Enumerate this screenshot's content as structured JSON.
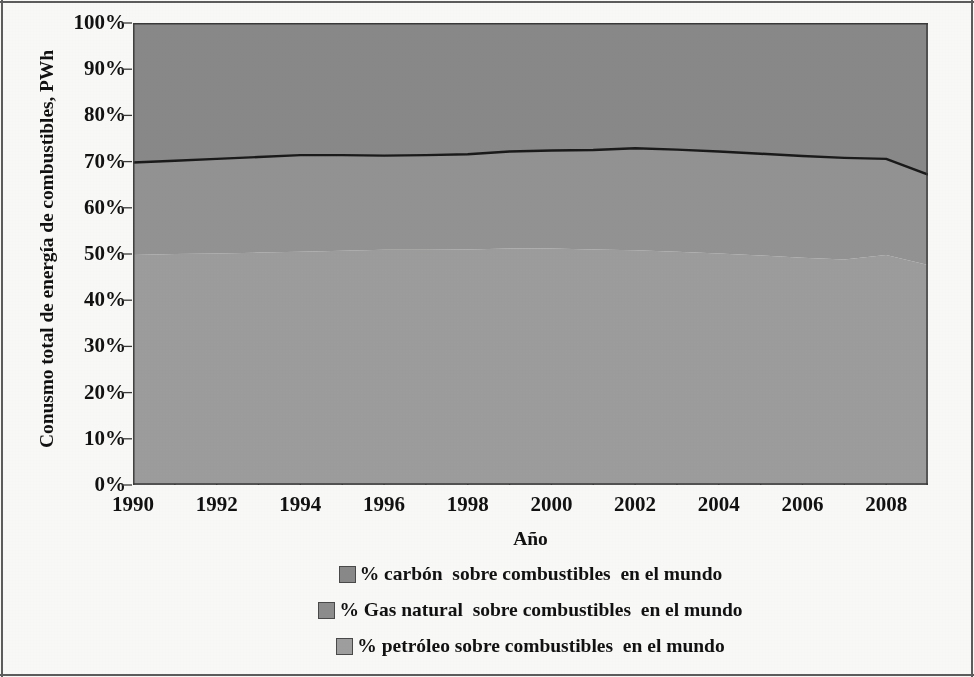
{
  "chart_data": {
    "type": "area",
    "title": "",
    "xlabel": "Año",
    "ylabel": "Conusmo total de energía de combustibles, PWh",
    "xlim": [
      1990,
      2009
    ],
    "ylim": [
      0,
      1
    ],
    "grid": false,
    "stacked": true,
    "legend_position": "bottom",
    "x": [
      1990,
      1991,
      1992,
      1993,
      1994,
      1995,
      1996,
      1997,
      1998,
      1999,
      2000,
      2001,
      2002,
      2003,
      2004,
      2005,
      2006,
      2007,
      2008,
      2009
    ],
    "xtick_labels": [
      "1990",
      "1992",
      "1994",
      "1996",
      "1998",
      "2000",
      "2002",
      "2004",
      "2006",
      "2008"
    ],
    "xtick_values": [
      1990,
      1992,
      1994,
      1996,
      1998,
      2000,
      2002,
      2004,
      2006,
      2008
    ],
    "ytick_labels": [
      "100%",
      "90%",
      "80%",
      "70%",
      "60%",
      "50%",
      "40%",
      "30%",
      "20%",
      "10%",
      "0%"
    ],
    "ytick_values": [
      1.0,
      0.9,
      0.8,
      0.7,
      0.6,
      0.5,
      0.4,
      0.3,
      0.2,
      0.1,
      0.0
    ],
    "series": [
      {
        "name": "% carbón  sobre combustibles  en el mundo",
        "color": "#8a8a8a",
        "stack_order": 1,
        "values": [
          0.698,
          0.702,
          0.706,
          0.71,
          0.714,
          0.714,
          0.713,
          0.714,
          0.716,
          0.722,
          0.724,
          0.725,
          0.729,
          0.726,
          0.722,
          0.717,
          0.712,
          0.708,
          0.706,
          0.672
        ]
      },
      {
        "name": "% Gas natural  sobre combustibles  en el mundo",
        "color": "#949494",
        "stack_order": 2,
        "values": [
          0.498,
          0.5,
          0.501,
          0.503,
          0.505,
          0.507,
          0.509,
          0.509,
          0.51,
          0.512,
          0.512,
          0.51,
          0.508,
          0.505,
          0.501,
          0.497,
          0.492,
          0.488,
          0.498,
          0.476
        ]
      },
      {
        "name": "% petróleo sobre combustibles  en el mundo",
        "color": "#9e9e9e",
        "stack_order": 3,
        "values": [
          0,
          0,
          0,
          0,
          0,
          0,
          0,
          0,
          0,
          0,
          0,
          0,
          0,
          0,
          0,
          0,
          0,
          0,
          0,
          0
        ]
      }
    ]
  },
  "legend": {
    "items": [
      {
        "label": "% carbón  sobre combustibles  en el mundo",
        "color": "#8a8a8a"
      },
      {
        "label": "% Gas natural  sobre combustibles  en el mundo",
        "color": "#8e8e8e"
      },
      {
        "label": "% petróleo sobre combustibles  en el mundo",
        "color": "#a0a0a0"
      }
    ]
  },
  "axes": {
    "x_title": "Año",
    "y_title": "Conusmo total de energía de combustibles, PWh"
  },
  "colors": {
    "band_top": "#8a8a8a",
    "band_mid": "#949494",
    "band_bottom": "#9e9e9e",
    "line": "#1a1a1a",
    "axis": "#3a3a3a",
    "text": "#111111"
  }
}
